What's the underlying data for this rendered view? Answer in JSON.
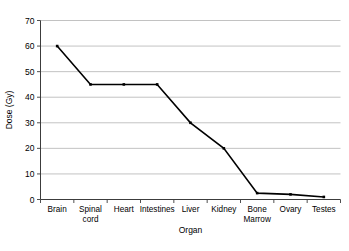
{
  "chart_data": {
    "type": "line",
    "title": "",
    "xlabel": "Organ",
    "ylabel": "Dose (Gy)",
    "categories": [
      "Brain",
      "Spinal cord",
      "Heart",
      "Intestines",
      "Liver",
      "Kidney",
      "Bone Marrow",
      "Ovary",
      "Testes"
    ],
    "category_lines": [
      [
        "Brain"
      ],
      [
        "Spinal",
        "cord"
      ],
      [
        "Heart"
      ],
      [
        "Intestines"
      ],
      [
        "Liver"
      ],
      [
        "Kidney"
      ],
      [
        "Bone",
        "Marrow"
      ],
      [
        "Ovary"
      ],
      [
        "Testes"
      ]
    ],
    "values": [
      60,
      45,
      45,
      45,
      30,
      20,
      2.5,
      2,
      1
    ],
    "ylim": [
      0,
      70
    ],
    "ytick_values": [
      0,
      10,
      20,
      30,
      40,
      50,
      60,
      70
    ],
    "ytick_labels": [
      "0",
      "10",
      "20",
      "30",
      "40",
      "50",
      "60",
      "70"
    ],
    "grid": "horizontal",
    "legend": "none",
    "series_color": "#000000",
    "grid_color": "#b3b3b3",
    "axis_color": "#3c3c3c",
    "background": "#ffffff",
    "marker": "square"
  },
  "axes": {
    "y_title": "Dose (Gy)",
    "x_title": "Organ"
  }
}
